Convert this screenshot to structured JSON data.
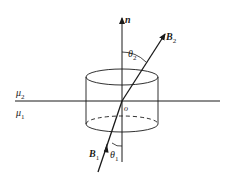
{
  "diagram": {
    "labels": {
      "normal": "n",
      "B2": "B",
      "B2_sub": "2",
      "theta2": "θ",
      "theta2_sub": "2",
      "mu2": "μ",
      "mu2_sub": "2",
      "mu1": "μ",
      "mu1_sub": "1",
      "origin": "o",
      "B1": "B",
      "B1_sub": "1",
      "theta1": "θ",
      "theta1_sub": "1"
    },
    "colors": {
      "ink": "#1a1a1a",
      "background": "#ffffff"
    }
  }
}
